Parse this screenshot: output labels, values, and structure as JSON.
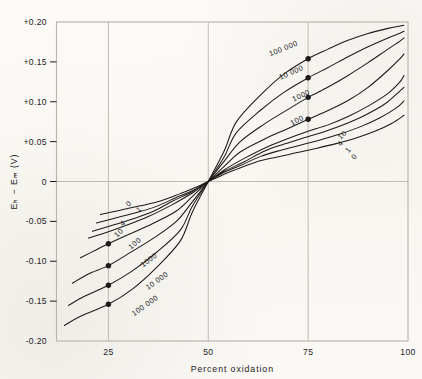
{
  "figure": {
    "background_color": "#fbfaf7",
    "ink_color": "#1d1b19",
    "grid_color": "#b9b5ad"
  },
  "chart_data": {
    "type": "line",
    "title": "",
    "xlabel": "Percent oxidation",
    "ylabel": "Eₕ − Eₘ (V)",
    "xlim": [
      12,
      100
    ],
    "ylim": [
      -0.2,
      0.2
    ],
    "xticks": [
      25,
      50,
      75,
      100
    ],
    "xtick_labels": [
      "25",
      "50",
      "75",
      "100"
    ],
    "yticks": [
      0.2,
      0.15,
      0.1,
      0.05,
      0,
      -0.05,
      -0.1,
      -0.15,
      -0.2
    ],
    "ytick_labels": [
      "+0.20",
      "+0.15",
      "+0.10",
      "+0.05",
      "0",
      "-0.05",
      "-0.10",
      "-0.15",
      "-0.20"
    ],
    "grid": "major gridlines at x=25,50,75 and y=0 only",
    "legend": "none; curves labelled inline on both branches",
    "marker_x_positions": [
      25,
      75
    ],
    "marker_style": "filled black circle",
    "series": [
      {
        "name": "0",
        "label": "0",
        "markers": false,
        "x": [
          23,
          28,
          33,
          38,
          43,
          46,
          50,
          54,
          57,
          62,
          67,
          72,
          77,
          82,
          87,
          92,
          96,
          99
        ],
        "y": [
          -0.0415,
          -0.036,
          -0.0305,
          -0.0245,
          -0.0152,
          -0.0092,
          0.0,
          0.0092,
          0.0152,
          0.0245,
          0.0305,
          0.036,
          0.0415,
          0.0475,
          0.0545,
          0.0635,
          0.073,
          0.083
        ]
      },
      {
        "name": "1",
        "label": "1",
        "markers": false,
        "x": [
          22,
          27,
          32,
          37,
          42,
          46,
          50,
          54,
          58,
          63,
          68,
          73,
          78,
          83,
          88,
          93,
          97,
          99
        ],
        "y": [
          -0.052,
          -0.0455,
          -0.039,
          -0.0312,
          -0.02,
          -0.0115,
          0.0,
          0.0115,
          0.02,
          0.0312,
          0.039,
          0.0455,
          0.052,
          0.0595,
          0.0685,
          0.08,
          0.092,
          0.101
        ]
      },
      {
        "name": "4",
        "label": "4",
        "markers": false,
        "x": [
          21,
          26,
          31,
          36,
          41,
          46,
          50,
          54,
          59,
          64,
          69,
          74,
          79,
          84,
          89,
          94,
          97,
          99
        ],
        "y": [
          -0.0625,
          -0.055,
          -0.047,
          -0.038,
          -0.0248,
          -0.0128,
          0.0,
          0.0128,
          0.0248,
          0.038,
          0.047,
          0.055,
          0.0625,
          0.0715,
          0.0825,
          0.0965,
          0.109,
          0.118
        ]
      },
      {
        "name": "10",
        "label": "10",
        "markers": false,
        "x": [
          20,
          25,
          30,
          35,
          41,
          46,
          50,
          54,
          59,
          65,
          70,
          75,
          80,
          85,
          90,
          95,
          98,
          99
        ],
        "y": [
          -0.071,
          -0.063,
          -0.054,
          -0.044,
          -0.029,
          -0.0145,
          0.0,
          0.0145,
          0.029,
          0.044,
          0.054,
          0.063,
          0.071,
          0.0815,
          0.0945,
          0.1105,
          0.125,
          0.133
        ]
      },
      {
        "name": "100",
        "label": "100",
        "markers": true,
        "marker_points": [
          {
            "x": 25,
            "y": -0.078
          },
          {
            "x": 75,
            "y": 0.078
          }
        ],
        "x": [
          18,
          22,
          25,
          30,
          36,
          42,
          46,
          50,
          54,
          58,
          64,
          70,
          75,
          80,
          85,
          90,
          95,
          98,
          99
        ],
        "y": [
          -0.0955,
          -0.0855,
          -0.078,
          -0.0665,
          -0.053,
          -0.037,
          -0.019,
          0.0,
          0.019,
          0.037,
          0.053,
          0.0665,
          0.078,
          0.089,
          0.1015,
          0.118,
          0.1395,
          0.154,
          0.16
        ]
      },
      {
        "name": "1000",
        "label": "1000",
        "markers": true,
        "marker_points": [
          {
            "x": 25,
            "y": -0.1055
          },
          {
            "x": 75,
            "y": 0.1055
          }
        ],
        "x": [
          16,
          20,
          25,
          30,
          36,
          42,
          46,
          50,
          54,
          58,
          64,
          70,
          75,
          80,
          85,
          90,
          95,
          98,
          99
        ],
        "y": [
          -0.1275,
          -0.116,
          -0.1055,
          -0.0905,
          -0.072,
          -0.05,
          -0.0255,
          0.0,
          0.0255,
          0.05,
          0.072,
          0.0905,
          0.1055,
          0.1185,
          0.133,
          0.149,
          0.166,
          0.176,
          0.18
        ]
      },
      {
        "name": "10 000",
        "label": "10 000",
        "markers": true,
        "marker_points": [
          {
            "x": 25,
            "y": -0.13
          },
          {
            "x": 75,
            "y": 0.13
          }
        ],
        "x": [
          15,
          19,
          25,
          31,
          37,
          43,
          46,
          50,
          54,
          57,
          63,
          69,
          75,
          80,
          85,
          90,
          95,
          98,
          99
        ],
        "y": [
          -0.1555,
          -0.144,
          -0.13,
          -0.112,
          -0.089,
          -0.061,
          -0.031,
          0.0,
          0.031,
          0.061,
          0.089,
          0.112,
          0.13,
          0.143,
          0.1565,
          0.169,
          0.18,
          0.186,
          0.1885
        ]
      },
      {
        "name": "100 000",
        "label": "100 000",
        "markers": true,
        "marker_points": [
          {
            "x": 25,
            "y": -0.154
          },
          {
            "x": 75,
            "y": 0.154
          }
        ],
        "x": [
          14,
          18,
          25,
          31,
          37,
          43,
          46,
          50,
          54,
          57,
          63,
          69,
          75,
          80,
          85,
          90,
          95,
          98,
          99
        ],
        "y": [
          -0.1805,
          -0.169,
          -0.154,
          -0.135,
          -0.108,
          -0.0745,
          -0.0385,
          0.0,
          0.0385,
          0.0745,
          0.108,
          0.135,
          0.154,
          0.166,
          0.177,
          0.1855,
          0.192,
          0.195,
          0.196
        ]
      }
    ],
    "inline_labels_left": [
      "0",
      "1",
      "4",
      "10",
      "100",
      "1000",
      "10 000",
      "100 000"
    ],
    "inline_labels_right": [
      "100 000",
      "10 000",
      "1000",
      "100",
      "10",
      "4",
      "1",
      "0"
    ]
  }
}
